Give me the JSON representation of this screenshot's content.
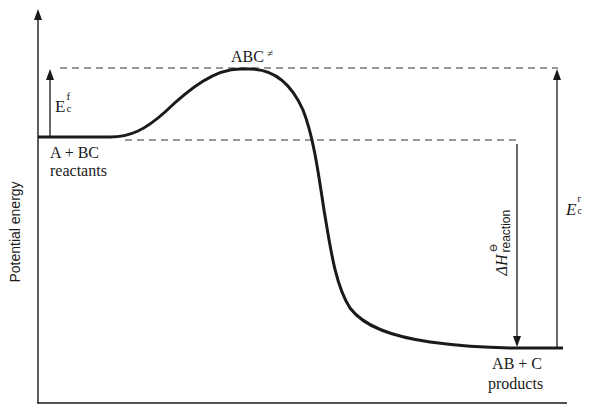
{
  "diagram": {
    "type": "reaction-energy-profile",
    "y_axis": {
      "label": "Potential energy"
    },
    "x_axis": {
      "label": ""
    },
    "states": {
      "reactants": {
        "formula": "A + BC",
        "name": "reactants"
      },
      "transition_state": {
        "formula": "ABC",
        "symbol": "≠"
      },
      "products": {
        "formula": "AB + C",
        "name": "products"
      }
    },
    "annotations": {
      "forward_activation": {
        "base": "E",
        "subscript": "c",
        "superscript": "f"
      },
      "reverse_activation": {
        "base": "E",
        "subscript": "c",
        "superscript": "r"
      },
      "enthalpy_change": {
        "base": "ΔH",
        "superscript": "⊖",
        "subscript": "reaction"
      }
    },
    "colors": {
      "ink": "#1a1a1a",
      "background": "#ffffff"
    }
  }
}
